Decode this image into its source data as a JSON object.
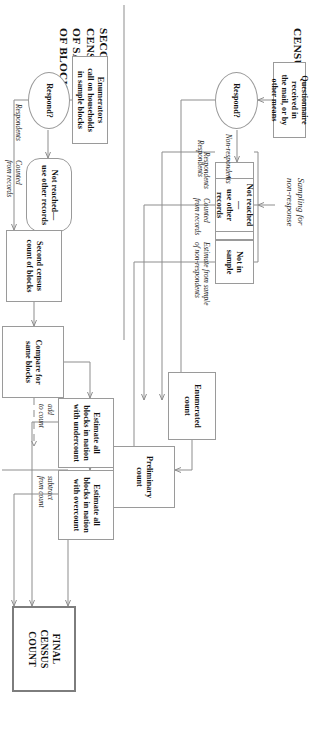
{
  "diagram": {
    "type": "flowchart",
    "title_top": "CENSUS",
    "title_bottom": "SECOND\nCENSUS\nOF SAMPLE\nOF BLOCKS",
    "nodes": [
      {
        "id": "questionnaire",
        "label": "Questionnaire\nreceived in\nthe mail, or by\nother means",
        "shape": "rect"
      },
      {
        "id": "respond_main",
        "label": "Respond?",
        "shape": "oval"
      },
      {
        "id": "enum_sample",
        "label": "Enumerators\ncall on sample",
        "shape": "rect"
      },
      {
        "id": "not_reached_main",
        "label": "Not reached—\nuse other records",
        "shape": "rect"
      },
      {
        "id": "not_in_sample",
        "label": "Not in sample",
        "shape": "rect"
      },
      {
        "id": "enumerated_count",
        "label": "Enumerated\ncount",
        "shape": "rect"
      },
      {
        "id": "preliminary_count",
        "label": "Preliminary\ncount",
        "shape": "rect"
      },
      {
        "id": "enum_households",
        "label": "Enumerators\ncall on households\nin sample blocks",
        "shape": "rect"
      },
      {
        "id": "respond_second",
        "label": "Respond?",
        "shape": "oval"
      },
      {
        "id": "not_reached_second",
        "label": "Not reached—\nuse other records",
        "shape": "round"
      },
      {
        "id": "second_census",
        "label": "Second census\ncount of blocks",
        "shape": "rect"
      },
      {
        "id": "compare",
        "label": "Compare for\nsame blocks",
        "shape": "rect"
      },
      {
        "id": "undercount",
        "label": "Estimate all\nblocks in nation\nwith undercount",
        "shape": "rect"
      },
      {
        "id": "overcount",
        "label": "Estimate all\nblocks in nation\nwith overcount",
        "shape": "rect"
      },
      {
        "id": "final",
        "label": "FINAL\nCENSUS\nCOUNT",
        "shape": "rect-double"
      }
    ],
    "edge_labels": [
      {
        "id": "respondents_main",
        "text": "Respondents"
      },
      {
        "id": "non_respondents",
        "text": "Non-respondents"
      },
      {
        "id": "sampling_for_nonresponse",
        "text": "Sampling for\nnon-response"
      },
      {
        "id": "respondents_sample",
        "text": "Respondents"
      },
      {
        "id": "counted_from_records",
        "text": "Counted\nfrom records"
      },
      {
        "id": "estimate_from_sample",
        "text": "Estimate from sample\nof non-respondents"
      },
      {
        "id": "respondents_second",
        "text": "Respondents"
      },
      {
        "id": "counted_from_records_second",
        "text": "Counted\nfrom records"
      },
      {
        "id": "add_to_count",
        "text": "add\nto count"
      },
      {
        "id": "subtract_from_count",
        "text": "subtract\nfrom count"
      }
    ]
  }
}
